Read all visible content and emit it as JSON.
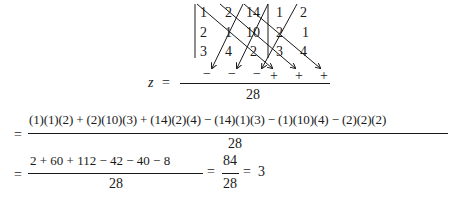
{
  "matrix": {
    "rows": [
      [
        "1",
        "2",
        "14",
        "1",
        "2"
      ],
      [
        "2",
        "1",
        "10",
        "2",
        "1"
      ],
      [
        "3",
        "4",
        "2",
        "3",
        "4"
      ]
    ],
    "diagonal_signs": [
      "−",
      "−",
      "−",
      "+",
      "+",
      "+"
    ]
  },
  "step1": {
    "lhs": "z",
    "equals": "=",
    "denominator": "28"
  },
  "step2": {
    "equals": "=",
    "numerator": "(1)(1)(2) + (2)(10)(3) + (14)(2)(4) − (14)(1)(3) − (1)(10)(4) − (2)(2)(2)",
    "denominator": "28"
  },
  "step3": {
    "equals": "=",
    "numerator": "2 + 60 + 112 − 42 − 40 − 8",
    "denominator": "28",
    "equals2": "=",
    "simplified_numerator": "84",
    "simplified_denominator": "28",
    "equals3": "=",
    "result": "3"
  }
}
